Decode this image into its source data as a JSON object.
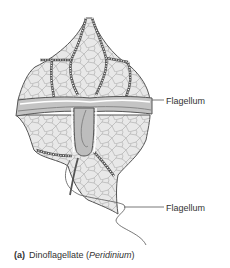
{
  "figure": {
    "colors": {
      "cell_fill": "#e6e6e6",
      "plate_lines": "#8a8a8a",
      "outline": "#555555",
      "suture": "#666666",
      "groove_fill": "#b8b8b8",
      "groove_highlight": "#ffffff",
      "flagellum_line": "#555555",
      "text": "#333333",
      "background": "#ffffff"
    }
  },
  "labels": {
    "flagellum_transverse": "Flagellum",
    "flagellum_longitudinal": "Flagellum"
  },
  "caption": {
    "part": "(a)",
    "name": "Dinoflagellate",
    "open_paren": " (",
    "genus": "Peridinium",
    "close_paren": ")"
  }
}
